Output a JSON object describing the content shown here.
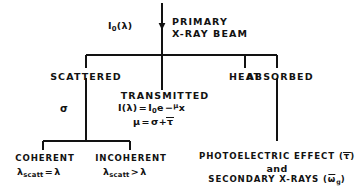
{
  "diagram": {
    "line_color": "#121212",
    "background": "#ffffff",
    "nodes": {
      "beam_intensity": "I",
      "beam_intensity_sub": "0",
      "beam_intensity_arg": "(λ)",
      "primary_line1": "PRIMARY",
      "primary_line2": "X-RAY BEAM",
      "scattered": "SCATTERED",
      "heat": "HEAT",
      "absorbed": "ABSORBED",
      "transmitted": "TRANSMITTED",
      "sigma": "σ",
      "coherent": "COHERENT",
      "incoherent": "INCOHERENT",
      "photoelectric": "PHOTOELECTRIC  EFFECT (",
      "photoelectric_tau": "τ",
      "photoelectric_end": ")",
      "and": "and",
      "secondary": "SECONDARY  X-RAYS (",
      "secondary_omega": "ω",
      "secondary_sub": "g",
      "secondary_end": ")"
    },
    "equations": {
      "transmitted_intensity": "I(λ) = I₀e⁻ᵟx",
      "attenuation": "μ = σ + τ",
      "coherent_wavelength": "λ_scatt = λ",
      "incoherent_wavelength": "λ_scatt > λ",
      "parts": {
        "I": "I",
        "lambda_arg": "(λ)",
        "equals": "=",
        "I0": "I",
        "zero": "0",
        "e": "e",
        "minus": "−",
        "mu": "μ",
        "x": "x",
        "sigma": "σ",
        "plus": "+",
        "tau": "τ",
        "lambda": "λ",
        "scatt": "scatt",
        "gt": ">"
      }
    }
  }
}
